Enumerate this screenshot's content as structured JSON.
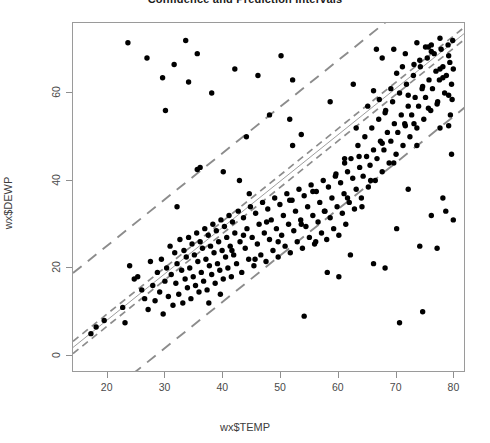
{
  "chart_data": {
    "type": "scatter",
    "title": "Confidence and Prediction Intervals",
    "xlabel": "wx$TEMP",
    "ylabel": "wx$DEWP",
    "xlim": [
      14,
      82
    ],
    "ylim": [
      -4,
      76
    ],
    "xticks": [
      20,
      30,
      40,
      50,
      60,
      70,
      80
    ],
    "yticks": [
      0,
      20,
      40,
      60
    ],
    "grid": false,
    "legend": "none",
    "colors": {
      "point": "#000000",
      "fit_line": "#9e9e9e",
      "interval_line": "#8c8c8c",
      "frame": "#9a9a9a",
      "text": "#3a3a3a"
    },
    "fit": {
      "slope": 1.06,
      "intercept": -13.0,
      "label": "least-squares fit"
    },
    "confidence_interval": {
      "halfwidth": 1.4,
      "style": "dashed",
      "label": "95% confidence interval"
    },
    "prediction_interval": {
      "halfwidth": 17.0,
      "style": "dashed",
      "label": "95% prediction interval"
    },
    "x": [
      17.1,
      18.0,
      19.4,
      22.6,
      23.0,
      23.8,
      24.6,
      25.2,
      25.9,
      26.4,
      27.0,
      27.4,
      27.8,
      28.2,
      28.6,
      29.0,
      29.3,
      29.6,
      29.9,
      30.2,
      30.5,
      30.8,
      31.0,
      31.3,
      31.6,
      31.8,
      32.0,
      32.3,
      32.5,
      32.8,
      33.0,
      33.2,
      33.4,
      33.6,
      33.8,
      34.0,
      34.2,
      34.4,
      34.6,
      34.8,
      35.0,
      35.2,
      35.4,
      35.6,
      35.8,
      36.0,
      36.2,
      36.4,
      36.6,
      36.8,
      37.0,
      37.2,
      37.4,
      37.6,
      37.8,
      38.0,
      38.2,
      38.4,
      38.6,
      38.8,
      39.0,
      39.2,
      39.4,
      39.6,
      39.8,
      40.0,
      40.2,
      40.4,
      40.6,
      40.8,
      41.0,
      41.2,
      41.4,
      41.6,
      41.8,
      42.0,
      42.3,
      42.6,
      42.9,
      43.2,
      43.5,
      43.8,
      44.1,
      44.4,
      44.7,
      45.0,
      45.3,
      45.6,
      45.9,
      46.2,
      46.5,
      46.8,
      47.1,
      47.4,
      47.7,
      48.0,
      48.3,
      48.6,
      48.9,
      49.2,
      49.5,
      49.8,
      50.1,
      50.4,
      50.7,
      51.0,
      51.3,
      51.6,
      51.9,
      52.2,
      52.5,
      52.8,
      53.1,
      53.4,
      53.7,
      54.0,
      54.3,
      54.6,
      54.9,
      55.2,
      55.5,
      55.8,
      56.1,
      56.4,
      56.7,
      57.0,
      57.3,
      57.6,
      57.9,
      58.2,
      58.5,
      58.8,
      59.1,
      59.4,
      59.7,
      60.0,
      60.3,
      60.6,
      60.9,
      61.2,
      61.5,
      61.8,
      62.1,
      62.4,
      62.7,
      63.0,
      63.3,
      63.6,
      63.9,
      64.2,
      64.5,
      64.8,
      65.1,
      65.4,
      65.7,
      66.0,
      66.3,
      66.6,
      66.9,
      67.2,
      67.5,
      67.8,
      68.1,
      68.4,
      68.7,
      69.0,
      69.3,
      69.6,
      69.9,
      70.2,
      70.5,
      70.8,
      71.1,
      71.4,
      71.7,
      72.0,
      72.3,
      72.6,
      72.9,
      73.2,
      73.5,
      73.8,
      74.1,
      74.4,
      74.7,
      75.0,
      75.3,
      75.6,
      75.9,
      76.2,
      76.5,
      76.8,
      77.1,
      77.4,
      77.7,
      78.0,
      78.3,
      78.6,
      78.9,
      79.2,
      79.5,
      79.8,
      23.5,
      26.8,
      29.5,
      31.5,
      33.5,
      35.5,
      37.5,
      39.5,
      41.5,
      43.5,
      45.5,
      47.5,
      49.5,
      51.5,
      53.5,
      55.5,
      57.5,
      59.5,
      61.5,
      63.5,
      65.5,
      67.5,
      69.5,
      71.5,
      73.5,
      75.5,
      77.5,
      79.0,
      30.0,
      34.0,
      38.0,
      42.0,
      46.0,
      50.0,
      54.0,
      58.0,
      62.0,
      66.0,
      70.0,
      74.0,
      78.0,
      32.0,
      36.0,
      40.0,
      44.0,
      48.0,
      52.0,
      56.0,
      60.0,
      64.0,
      68.0,
      72.0,
      76.0,
      79.5,
      42.8,
      51.5,
      52.0,
      58.5,
      62.5,
      66.5,
      70.5,
      74.5,
      78.5,
      35.5,
      44.5,
      53.5,
      61.0,
      67.0,
      73.0,
      77.0,
      79.8,
      61.0,
      63.0,
      65.0,
      69.0,
      71.0,
      75.0,
      77.0,
      79.0,
      66.0,
      68.0,
      70.0,
      72.0,
      74.0,
      76.0,
      78.0,
      79.6,
      73.0,
      74.5,
      76.0,
      77.5,
      79.0,
      79.7,
      67.5,
      69.5,
      71.5,
      73.5,
      75.5,
      77.5,
      79.3
    ],
    "y": [
      5.0,
      6.5,
      8.0,
      11.0,
      7.5,
      20.5,
      17.5,
      18.0,
      15.0,
      13.0,
      10.5,
      21.5,
      16.0,
      12.5,
      19.0,
      14.5,
      22.0,
      9.5,
      17.0,
      20.0,
      13.5,
      25.0,
      18.5,
      11.5,
      23.5,
      16.5,
      21.0,
      14.0,
      26.5,
      19.5,
      12.0,
      24.0,
      17.5,
      22.5,
      15.5,
      27.0,
      20.0,
      13.0,
      25.5,
      18.0,
      23.0,
      16.0,
      28.0,
      21.5,
      14.5,
      26.0,
      19.0,
      24.5,
      17.0,
      29.0,
      22.0,
      15.0,
      27.5,
      20.5,
      25.0,
      18.5,
      30.0,
      23.5,
      16.5,
      28.5,
      21.0,
      26.0,
      19.5,
      31.0,
      24.0,
      17.5,
      29.5,
      22.5,
      27.0,
      20.0,
      32.0,
      25.0,
      18.0,
      30.5,
      23.0,
      28.0,
      21.0,
      33.0,
      26.0,
      19.0,
      31.5,
      24.5,
      29.0,
      22.0,
      34.0,
      27.0,
      20.5,
      32.5,
      25.5,
      30.0,
      23.0,
      35.0,
      28.0,
      21.5,
      33.5,
      26.5,
      31.0,
      24.0,
      36.0,
      29.0,
      22.5,
      34.5,
      27.5,
      32.0,
      25.0,
      37.0,
      30.0,
      23.5,
      35.5,
      28.5,
      33.0,
      26.0,
      38.0,
      31.0,
      24.5,
      36.5,
      29.5,
      34.0,
      27.0,
      39.0,
      32.0,
      25.5,
      37.5,
      30.5,
      35.0,
      28.0,
      40.0,
      33.0,
      26.5,
      38.5,
      31.5,
      36.0,
      29.0,
      41.0,
      34.0,
      27.5,
      39.5,
      32.5,
      37.0,
      30.0,
      42.0,
      35.0,
      45.0,
      40.5,
      33.5,
      38.0,
      48.0,
      43.0,
      36.0,
      41.0,
      50.0,
      45.5,
      38.5,
      43.5,
      52.0,
      47.0,
      40.0,
      45.0,
      54.0,
      49.0,
      42.0,
      47.0,
      56.0,
      51.0,
      44.0,
      49.0,
      58.0,
      53.0,
      46.0,
      51.0,
      60.0,
      55.0,
      48.0,
      53.0,
      62.0,
      57.0,
      50.0,
      55.0,
      64.0,
      59.0,
      52.0,
      57.0,
      66.0,
      61.0,
      54.0,
      59.0,
      68.0,
      63.0,
      56.0,
      61.0,
      69.0,
      65.0,
      58.0,
      63.0,
      70.0,
      66.0,
      60.0,
      64.0,
      71.0,
      67.0,
      62.0,
      65.5,
      71.5,
      68.0,
      63.5,
      66.5,
      72.0,
      69.0,
      12.0,
      14.0,
      24.0,
      27.5,
      22.0,
      30.5,
      26.0,
      35.5,
      30.0,
      37.5,
      33.0,
      41.5,
      36.0,
      45.5,
      40.0,
      48.5,
      44.0,
      52.5,
      48.0,
      56.5,
      52.0,
      59.5,
      56.0,
      62.5,
      60.0,
      65.5,
      64.0,
      68.5,
      9.0,
      19.0,
      23.0,
      21.0,
      29.0,
      25.0,
      36.0,
      34.0,
      43.0,
      42.0,
      50.0,
      55.0,
      63.0,
      26.0,
      18.0,
      34.0,
      20.0,
      38.0,
      32.0,
      46.0,
      40.0,
      54.0,
      48.0,
      58.0,
      62.0,
      70.0,
      7.5,
      10.0,
      33.0,
      42.5,
      37.0,
      50.5,
      45.0,
      58.5,
      53.0,
      24.5,
      31.0,
      44.0,
      52.0,
      57.0,
      61.0,
      66.0,
      70.5,
      57.5,
      52.5,
      60.5,
      55.5,
      64.5,
      59.5,
      67.5,
      71.0,
      63.5,
      58.5,
      66.5,
      61.5,
      69.5,
      65.5,
      68.5,
      72.0,
      68.0,
      70.0,
      69.0,
      71.5,
      70.5,
      72.5,
      55.0,
      62.0,
      57.0,
      64.5,
      60.0,
      67.0,
      69.8
    ]
  }
}
